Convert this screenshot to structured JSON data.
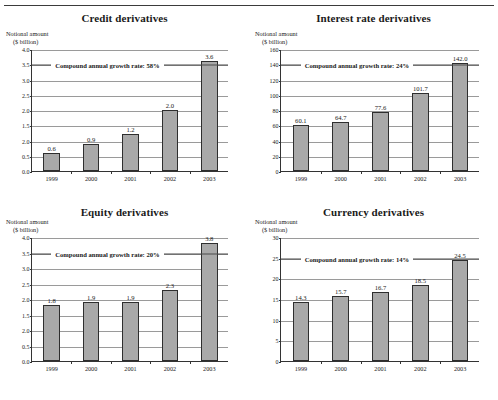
{
  "page": {
    "rule": "horizontal-rule"
  },
  "axis_caption": {
    "line1": "Notional amount",
    "line2": "($ billion)"
  },
  "chart_data": [
    {
      "id": "credit",
      "type": "bar",
      "title": "Credit derivatives",
      "xlabel": "",
      "ylabel": "Notional amount ($ billion)",
      "categories": [
        "1999",
        "2000",
        "2001",
        "2002",
        "2003"
      ],
      "values": [
        0.6,
        0.9,
        1.2,
        2.0,
        3.6
      ],
      "value_labels": [
        "0.6",
        "0.9",
        "1.2",
        "2.0",
        "3.6"
      ],
      "ylim": [
        0,
        4.0
      ],
      "yticks": [
        0.0,
        0.5,
        1.0,
        1.5,
        2.0,
        2.5,
        3.0,
        3.5,
        4.0
      ],
      "ytick_labels": [
        "0.0",
        "0.5",
        "2.0",
        "1.5",
        "2.0",
        "2.5",
        "3.0",
        "3.5",
        "4.0"
      ],
      "grid": true,
      "legend": "none",
      "annotation": {
        "text": "Compound annual growth rate: 58%",
        "at_y": 3.5
      }
    },
    {
      "id": "interest-rate",
      "type": "bar",
      "title": "Interest rate derivatives",
      "xlabel": "",
      "ylabel": "Notional amount ($ billion)",
      "categories": [
        "1999",
        "2000",
        "2001",
        "2002",
        "2003"
      ],
      "values": [
        60.1,
        64.7,
        77.6,
        101.7,
        142.0
      ],
      "value_labels": [
        "60.1",
        "64.7",
        "77.6",
        "101.7",
        "142.0"
      ],
      "ylim": [
        0,
        160
      ],
      "yticks": [
        0,
        20,
        40,
        60,
        80,
        100,
        120,
        140,
        160
      ],
      "ytick_labels": [
        "0",
        "20",
        "40",
        "60",
        "80",
        "100",
        "120",
        "140",
        "160"
      ],
      "grid": true,
      "legend": "none",
      "annotation": {
        "text": "Compound annual growth rate: 24%",
        "at_y": 140
      }
    },
    {
      "id": "equity",
      "type": "bar",
      "title": "Equity derivatives",
      "xlabel": "",
      "ylabel": "Notional amount ($ billion)",
      "categories": [
        "1999",
        "2000",
        "2001",
        "2002",
        "2003"
      ],
      "values": [
        1.8,
        1.9,
        1.9,
        2.3,
        3.8
      ],
      "value_labels": [
        "1.8",
        "1.9",
        "1.9",
        "2.3",
        "3.8"
      ],
      "ylim": [
        0,
        4.0
      ],
      "yticks": [
        0.0,
        0.5,
        1.0,
        1.5,
        2.0,
        2.5,
        3.0,
        3.5,
        4.0
      ],
      "ytick_labels": [
        "0.0",
        "0.5",
        "2.0",
        "1.5",
        "2.0",
        "2.5",
        "3.0",
        "3.5",
        "4.0"
      ],
      "grid": true,
      "legend": "none",
      "annotation": {
        "text": "Compound annual growth rate: 20%",
        "at_y": 3.5
      }
    },
    {
      "id": "currency",
      "type": "bar",
      "title": "Currency derivatives",
      "xlabel": "",
      "ylabel": "Notional amount ($ billion)",
      "categories": [
        "1999",
        "2000",
        "2001",
        "2002",
        "2003"
      ],
      "values": [
        14.3,
        15.7,
        16.7,
        18.5,
        24.5
      ],
      "value_labels": [
        "14.3",
        "15.7",
        "16.7",
        "18.5",
        "24.5"
      ],
      "ylim": [
        0,
        30
      ],
      "yticks": [
        0,
        5,
        10,
        15,
        20,
        25,
        30
      ],
      "ytick_labels": [
        "0",
        "5",
        "10",
        "15",
        "20",
        "25",
        "30"
      ],
      "grid": true,
      "legend": "none",
      "annotation": {
        "text": "Compound annual growth rate: 14%",
        "at_y": 25
      }
    }
  ]
}
